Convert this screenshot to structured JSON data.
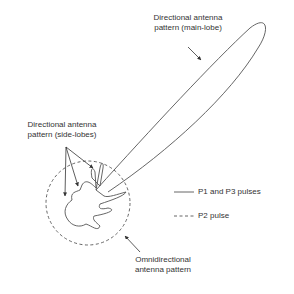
{
  "labels": {
    "main_lobe": {
      "line1": "Directional antenna",
      "line2": "pattern (main-lobe)"
    },
    "side_lobes": {
      "line1": "Directional antenna",
      "line2": "pattern (side-lobes)"
    },
    "omni": {
      "line1": "Omnidirectional",
      "line2": "antenna pattern"
    }
  },
  "legend": {
    "items": [
      {
        "style": "solid",
        "label": "P1 and P3 pulses"
      },
      {
        "style": "dashed",
        "label": "P2 pulse"
      }
    ]
  },
  "colors": {
    "stroke": "#555555",
    "text": "#333333",
    "background": "#ffffff"
  }
}
